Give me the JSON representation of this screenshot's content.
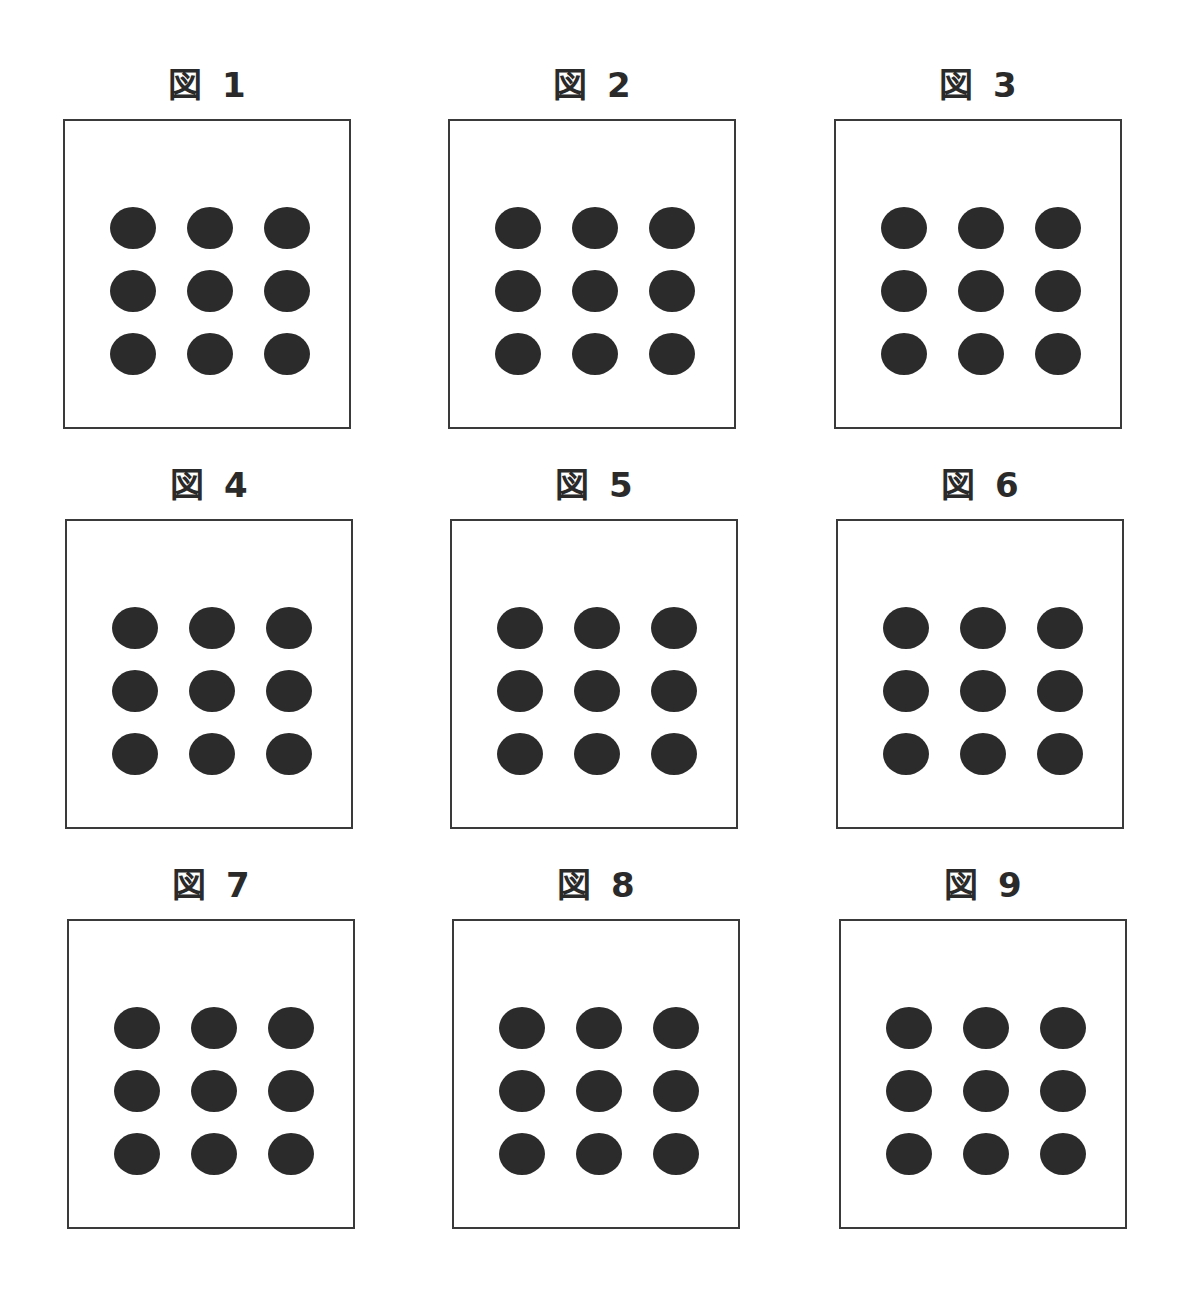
{
  "panels": [
    {
      "label": "図 1",
      "x": 63,
      "y": 65
    },
    {
      "label": "図 2",
      "x": 448,
      "y": 65
    },
    {
      "label": "図 3",
      "x": 834,
      "y": 65
    },
    {
      "label": "図 4",
      "x": 65,
      "y": 465
    },
    {
      "label": "図 5",
      "x": 450,
      "y": 465
    },
    {
      "label": "図 6",
      "x": 836,
      "y": 465
    },
    {
      "label": "図 7",
      "x": 67,
      "y": 865
    },
    {
      "label": "図 8",
      "x": 452,
      "y": 865
    },
    {
      "label": "図 9",
      "x": 839,
      "y": 865
    }
  ],
  "dot_grid": {
    "rows": 3,
    "cols": 3,
    "offset_x": 45,
    "offset_y": 86,
    "spacing_x": 77,
    "spacing_y": 63
  },
  "colors": {
    "dot": "#2b2b2b",
    "border": "#3a3a3a",
    "background": "#ffffff"
  }
}
